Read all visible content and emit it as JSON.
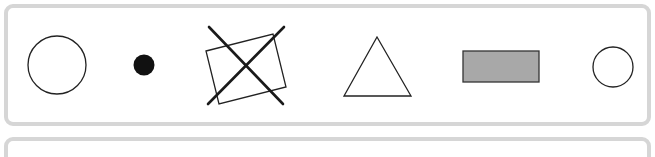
{
  "diagram": {
    "colors": {
      "panel_border": "#d6d6d6",
      "stroke": "#222222",
      "dot_fill": "#111111",
      "rect_fill": "#a8a8a8",
      "background": "#ffffff"
    },
    "shapes": [
      {
        "kind": "circle",
        "style": "outline",
        "label": "large-circle"
      },
      {
        "kind": "circle",
        "style": "filled",
        "label": "dot"
      },
      {
        "kind": "rectangle",
        "style": "outline-rotated-crossed-out",
        "label": "crossed-rectangle"
      },
      {
        "kind": "triangle",
        "style": "outline",
        "label": "triangle"
      },
      {
        "kind": "rectangle",
        "style": "gray-filled",
        "label": "gray-rectangle"
      },
      {
        "kind": "circle",
        "style": "outline",
        "label": "small-circle"
      }
    ],
    "panels": [
      {
        "label": "shapes-panel",
        "contents": "6 shapes"
      },
      {
        "label": "empty-panel",
        "contents": "empty (partially visible)"
      }
    ]
  }
}
